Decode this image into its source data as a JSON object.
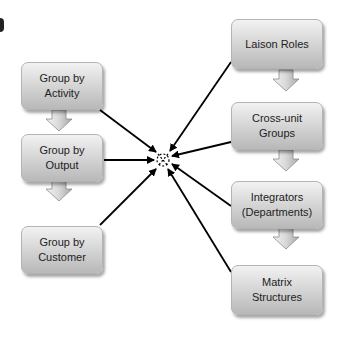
{
  "diagram": {
    "type": "convergence-diagram",
    "center": {
      "icon": "burst-target-icon",
      "x": 163,
      "y": 158
    },
    "left_column": [
      {
        "id": "activity",
        "lines": [
          "Group by",
          "Activity"
        ]
      },
      {
        "id": "output",
        "lines": [
          "Group by",
          "Output"
        ]
      },
      {
        "id": "customer",
        "lines": [
          "Group by",
          "Customer"
        ]
      }
    ],
    "right_column": [
      {
        "id": "liaison",
        "lines": [
          "Laison Roles"
        ]
      },
      {
        "id": "crossunit",
        "lines": [
          "Cross-unit",
          "Groups"
        ]
      },
      {
        "id": "integrators",
        "lines": [
          "Integrators",
          "(Departments)"
        ]
      },
      {
        "id": "matrix",
        "lines": [
          "Matrix",
          "Structures"
        ]
      }
    ],
    "flow_arrow_icon": "down-block-arrow-icon",
    "connector_icon": "arrow-line-icon",
    "colors": {
      "box_top": "#f2f2f2",
      "box_bottom": "#b8b8b8",
      "line": "#000000",
      "text": "#222222"
    }
  }
}
